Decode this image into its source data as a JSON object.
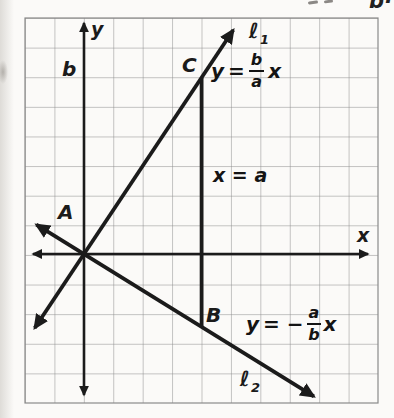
{
  "page_fragment": {
    "text": "b·"
  },
  "figure": {
    "axis": {
      "x": "x",
      "y": "y"
    },
    "tick": {
      "b": "b"
    },
    "points": {
      "a": "A",
      "b": "B",
      "c": "C"
    },
    "line1": {
      "ell": "ℓ",
      "sub": "1"
    },
    "line2": {
      "ell": "ℓ",
      "sub": "2"
    },
    "eq1": {
      "lhs": "y",
      "rel": "=",
      "num": "b",
      "den": "a",
      "var": "x"
    },
    "eq2": {
      "lhs": "y",
      "rel": "=",
      "minus": "−",
      "num": "a",
      "den": "b",
      "var": "x"
    },
    "eq_vertical": "x = a"
  },
  "colors": {
    "ink": "#1b1b1b",
    "grid_line": "#8a8a8a",
    "paper": "#fbfaf8"
  }
}
